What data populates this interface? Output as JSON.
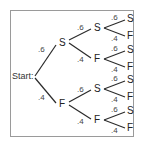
{
  "diagram": {
    "type": "probability-tree",
    "start_label": "Start:",
    "level1": [
      {
        "label": "S",
        "prob": ".6"
      },
      {
        "label": "F",
        "prob": ".4"
      }
    ],
    "level2": [
      {
        "label": "S",
        "prob": ".6"
      },
      {
        "label": "F",
        "prob": ".4"
      },
      {
        "label": "S",
        "prob": ".6"
      },
      {
        "label": "F",
        "prob": ".4"
      }
    ],
    "level3": [
      {
        "label": "S",
        "prob": ".6"
      },
      {
        "label": "F",
        "prob": ".4"
      },
      {
        "label": "S",
        "prob": ".6"
      },
      {
        "label": "F",
        "prob": ".4"
      },
      {
        "label": "S",
        "prob": ".6"
      },
      {
        "label": "F",
        "prob": ".4"
      },
      {
        "label": "S",
        "prob": ".6"
      },
      {
        "label": "F",
        "prob": ".4"
      }
    ]
  }
}
